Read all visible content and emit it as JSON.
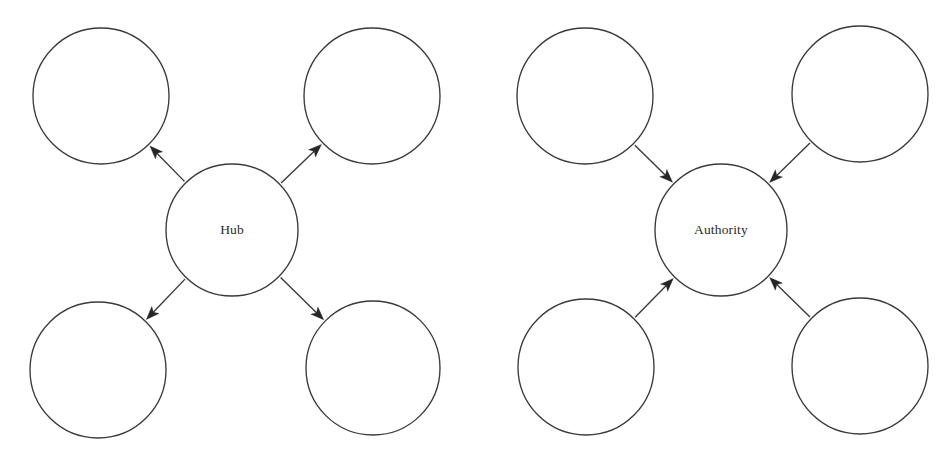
{
  "figure": {
    "background_color": "#ffffff",
    "width": 949,
    "height": 455,
    "stroke_color": "#3a3a3a",
    "arrow_fill_color": "#262626",
    "label_color": "#2b2b2b"
  },
  "diagrams": [
    {
      "id": "hub",
      "center_label": "Hub",
      "edge_direction": "outgoing",
      "center": {
        "cx": 232,
        "cy": 230,
        "r": 66
      },
      "satellites": [
        {
          "name": "top-left",
          "cx": 101,
          "cy": 96,
          "r": 68,
          "label": ""
        },
        {
          "name": "top-right",
          "cx": 372,
          "cy": 96,
          "r": 68,
          "label": ""
        },
        {
          "name": "bottom-left",
          "cx": 98,
          "cy": 370,
          "r": 68,
          "label": ""
        },
        {
          "name": "bottom-right",
          "cx": 373,
          "cy": 368,
          "r": 67,
          "label": ""
        }
      ]
    },
    {
      "id": "authority",
      "center_label": "Authority",
      "edge_direction": "incoming",
      "center": {
        "cx": 721,
        "cy": 230,
        "r": 66
      },
      "satellites": [
        {
          "name": "top-left",
          "cx": 585,
          "cy": 96,
          "r": 68,
          "label": ""
        },
        {
          "name": "top-right",
          "cx": 860,
          "cy": 94,
          "r": 68,
          "label": ""
        },
        {
          "name": "bottom-left",
          "cx": 586,
          "cy": 367,
          "r": 68,
          "label": ""
        },
        {
          "name": "bottom-right",
          "cx": 860,
          "cy": 366,
          "r": 68,
          "label": ""
        }
      ]
    }
  ],
  "geometry": {
    "arrow_head_length": 13,
    "arrow_head_half_width": 5.0,
    "edge_gap_from_node": 2
  }
}
